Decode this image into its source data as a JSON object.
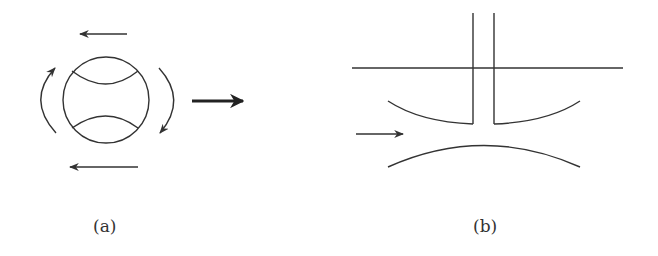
{
  "figure": {
    "panels": [
      {
        "id": "a",
        "label": "(a)",
        "description": "Spinning ball with seams, rotation arrows and motion arrow"
      },
      {
        "id": "b",
        "label": "(b)",
        "description": "Narrowing channel with vertical tube, flow arrow"
      }
    ],
    "colors": {
      "stroke": "#333333",
      "background": "#ffffff"
    }
  }
}
